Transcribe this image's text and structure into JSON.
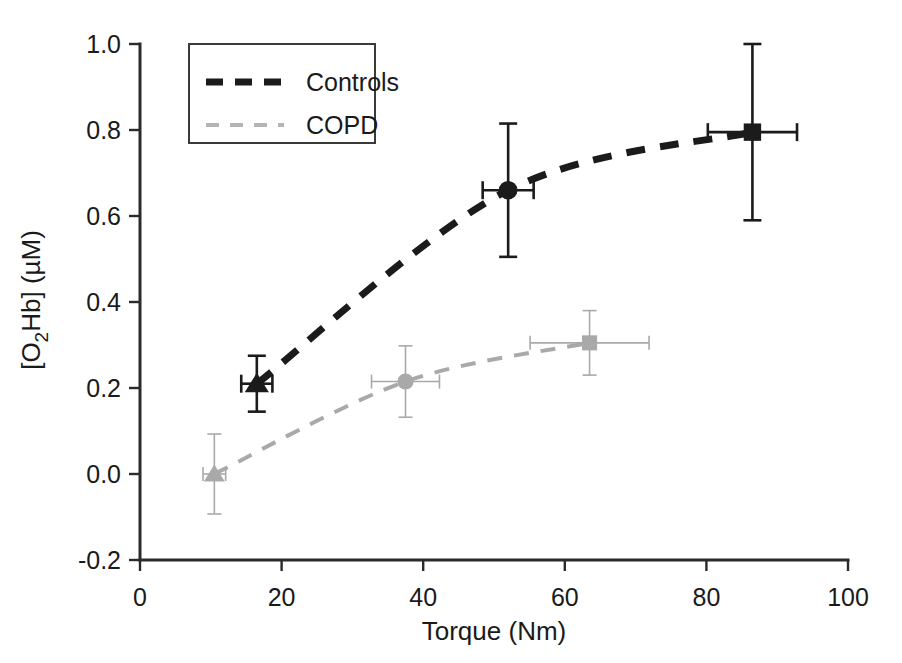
{
  "chart_data": {
    "type": "scatter",
    "title": "",
    "xlabel": "Torque (Nm)",
    "ylabel": "[O2Hb] (µM)",
    "ylabel_parts": {
      "pre": "[O",
      "sub": "2",
      "post": "Hb] (µM)"
    },
    "xlim": [
      0,
      100
    ],
    "ylim": [
      -0.2,
      1.0
    ],
    "xticks": [
      "0",
      "20",
      "40",
      "60",
      "80",
      "100"
    ],
    "xtick_values": [
      0,
      20,
      40,
      60,
      80,
      100
    ],
    "yticks": [
      "1.0",
      "0.8",
      "0.6",
      "0.4",
      "0.2",
      "0.0",
      "-0.2"
    ],
    "ytick_values": [
      1.0,
      0.8,
      0.6,
      0.4,
      0.2,
      0.0,
      -0.2
    ],
    "grid": false,
    "legend_position": "upper-left",
    "series": [
      {
        "name": "Controls",
        "color": "#1b1b1b",
        "linestyle": "dashed",
        "points": [
          {
            "marker": "triangle",
            "x": 16.5,
            "y": 0.21,
            "xerr": 2.2,
            "yerr": 0.065
          },
          {
            "marker": "circle",
            "x": 52.0,
            "y": 0.66,
            "xerr": 3.6,
            "yerr": 0.155
          },
          {
            "marker": "square",
            "x": 86.5,
            "y": 0.795,
            "xerr": 6.3,
            "yerr": 0.205
          }
        ]
      },
      {
        "name": "COPD",
        "color": "#a9a9a9",
        "linestyle": "dashed",
        "points": [
          {
            "marker": "triangle",
            "x": 10.5,
            "y": 0.0,
            "xerr": 1.6,
            "yerr": 0.093
          },
          {
            "marker": "circle",
            "x": 37.5,
            "y": 0.215,
            "xerr": 4.8,
            "yerr": 0.083
          },
          {
            "marker": "square",
            "x": 63.5,
            "y": 0.305,
            "xerr": 8.4,
            "yerr": 0.075
          }
        ]
      }
    ],
    "legend": [
      {
        "label": "Controls",
        "color": "#1b1b1b",
        "linestyle": "dashed",
        "weight": "heavy"
      },
      {
        "label": "COPD",
        "color": "#b4b4b4",
        "linestyle": "dashed",
        "weight": "light"
      }
    ]
  }
}
